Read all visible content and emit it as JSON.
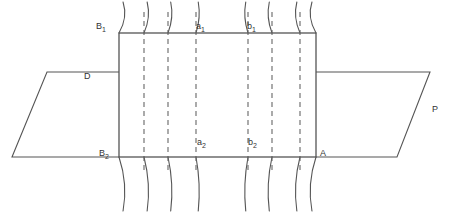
{
  "figure": {
    "type": "line-diagram",
    "background_color": "#ffffff",
    "stroke_color": "#555555",
    "canvas": {
      "width": 451,
      "height": 213
    }
  },
  "labels": {
    "b1": {
      "text": "B",
      "sub": "1",
      "x": 96,
      "y": 22
    },
    "a1": {
      "text": "a",
      "sub": "1",
      "x": 196,
      "y": 22
    },
    "bb1": {
      "text": "b",
      "sub": "1",
      "x": 247,
      "y": 22
    },
    "b2": {
      "text": "B",
      "sub": "2",
      "x": 99,
      "y": 149
    },
    "a2": {
      "text": "a",
      "sub": "2",
      "x": 197,
      "y": 138
    },
    "bb2": {
      "text": "b",
      "sub": "2",
      "x": 248,
      "y": 138
    },
    "a_corner": {
      "text": "A",
      "sub": "",
      "x": 320,
      "y": 149
    },
    "d": {
      "text": "D",
      "sub": "",
      "x": 84,
      "y": 72
    },
    "p": {
      "text": "P",
      "sub": "",
      "x": 432,
      "y": 105
    }
  },
  "chart_data": {
    "type": "line",
    "title": "",
    "xlabel": "",
    "ylabel": "",
    "grid": false,
    "legend": "none",
    "rectangle": {
      "x1": 119,
      "y1": 33,
      "x2": 316,
      "y2": 157
    },
    "left_trapezoid": {
      "points": "119,72 47,72 12,157 119,157"
    },
    "right_trapezoid": {
      "points": "316,72 430,72 397,157 316,157"
    },
    "dashed_line_x": [
      144,
      168,
      196,
      248,
      272,
      300
    ],
    "curves_top": [
      {
        "x": 119,
        "bow": 9
      },
      {
        "x": 144,
        "bow": 7
      },
      {
        "x": 168,
        "bow": 6
      },
      {
        "x": 196,
        "bow": 5
      },
      {
        "x": 248,
        "bow": -5
      },
      {
        "x": 272,
        "bow": -6
      },
      {
        "x": 300,
        "bow": -7
      },
      {
        "x": 316,
        "bow": -9
      }
    ],
    "curves_bottom": [
      {
        "x": 119,
        "bow": 9
      },
      {
        "x": 144,
        "bow": 7
      },
      {
        "x": 168,
        "bow": 6
      },
      {
        "x": 196,
        "bow": 5
      },
      {
        "x": 248,
        "bow": -5
      },
      {
        "x": 272,
        "bow": -6
      },
      {
        "x": 300,
        "bow": -7
      },
      {
        "x": 316,
        "bow": -9
      }
    ],
    "curve_top_extent": [
      33,
      2
    ],
    "curve_bottom_extent": [
      157,
      211
    ]
  }
}
